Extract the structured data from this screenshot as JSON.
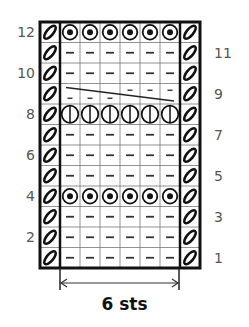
{
  "chart": {
    "rows": 12,
    "stitches": 6,
    "left_row_numbers": [
      "12",
      "10",
      "8",
      "6",
      "4",
      "2"
    ],
    "right_row_numbers": [
      "11",
      "9",
      "7",
      "5",
      "3",
      "1"
    ],
    "row_symbols": {
      "12": "circle-dot",
      "11": "dash",
      "10": "dash",
      "9": "diagonal-strand",
      "8": "circle-vertical-line",
      "7": "dash",
      "6": "dash",
      "5": "dash",
      "4": "circle-dot",
      "3": "dash",
      "2": "dash",
      "1": "dash"
    },
    "edge_symbol": "slash-oval",
    "width_label": "6 sts"
  }
}
